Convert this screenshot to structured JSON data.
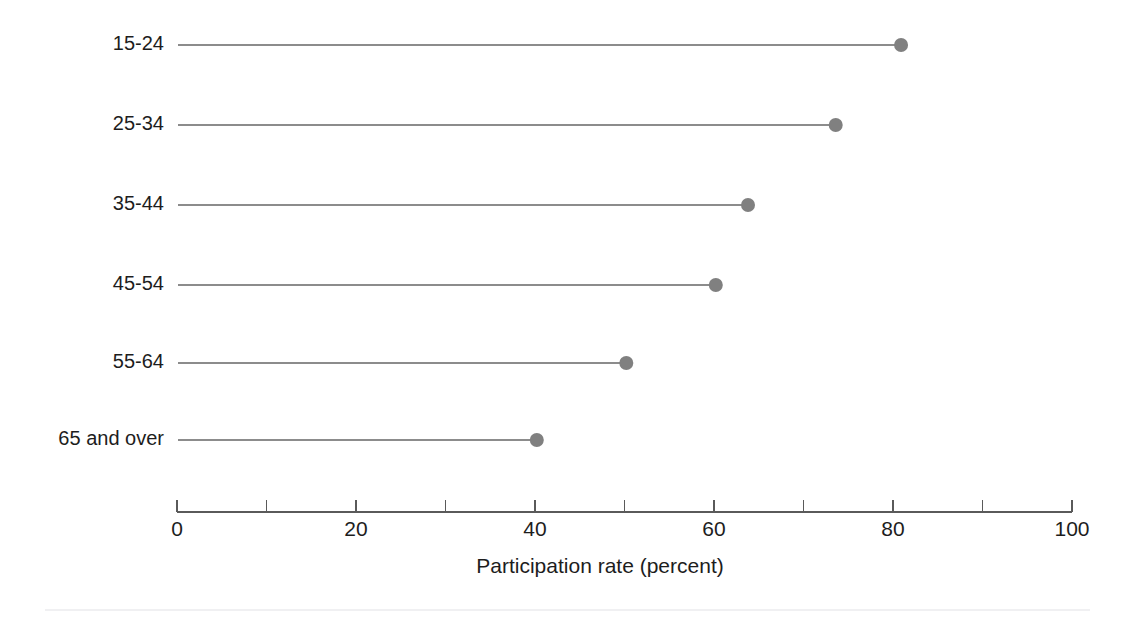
{
  "chart_data": {
    "type": "bar",
    "subtype": "lollipop-horizontal",
    "title": "",
    "subtitle": "",
    "xlabel": "Participation rate (percent)",
    "ylabel": "",
    "categories": [
      "15-24",
      "25-34",
      "35-44",
      "45-54",
      "55-64",
      "65 and over"
    ],
    "values": [
      80.9,
      73.6,
      63.8,
      60.2,
      50.2,
      40.2
    ],
    "xlim": [
      0,
      100
    ],
    "xticks": [
      0,
      20,
      40,
      60,
      80,
      100
    ],
    "xtick_labels": [
      "0",
      "20",
      "40",
      "60",
      "80",
      "100"
    ],
    "xminorticks": [
      10,
      30,
      50,
      70,
      90
    ],
    "grid": false,
    "legend": false,
    "legend_position": "none",
    "series": [
      {
        "name": "Participation rate",
        "values": [
          80.9,
          73.6,
          63.8,
          60.2,
          50.2,
          40.2
        ]
      }
    ],
    "points": [
      {
        "category": "15-24",
        "value": 80.9
      },
      {
        "category": "25-34",
        "value": 73.6
      },
      {
        "category": "35-44",
        "value": 63.8
      },
      {
        "category": "45-54",
        "value": 60.2
      },
      {
        "category": "55-64",
        "value": 50.2
      },
      {
        "category": "65 and over",
        "value": 40.2
      }
    ],
    "colors": {
      "marker": "#808080",
      "stem": "#8c8c8c",
      "axis": "#5a5a5a",
      "text": "#1d1d1d",
      "background": "#ffffff",
      "footer_rule": "#f0f0f2"
    },
    "geometry": {
      "x_origin_px": 177,
      "x_end_px": 1072,
      "axis_y_px": 512,
      "row_y_px": [
        45,
        125,
        205,
        285,
        363,
        440
      ],
      "marker_radius_px": 7,
      "tick_length_px": 12,
      "tick_label_y_px": 521,
      "axis_title_y_px": 558,
      "axis_title_x_px": 600,
      "label_right_px": 164,
      "footer_rule_y_px": 610,
      "footer_rule_x0_px": 45,
      "footer_rule_x1_px": 1090
    }
  }
}
